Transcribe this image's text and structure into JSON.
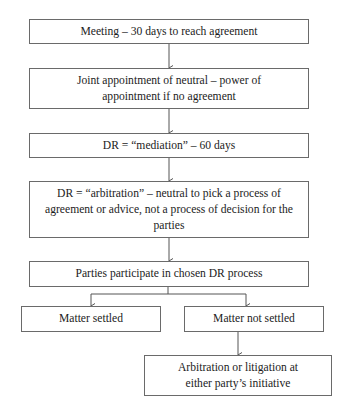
{
  "flowchart": {
    "nodes": [
      {
        "id": "meeting",
        "label": "Meeting – 30 days to reach agreement"
      },
      {
        "id": "joint-appointment",
        "label": "Joint appointment of neutral – power of appointment if no agreement"
      },
      {
        "id": "mediation",
        "label": "DR = “mediation” – 60 days"
      },
      {
        "id": "arbitration-process",
        "label": "DR = “arbitration” – neutral to pick a process of agreement or advice, not a process of decision for the parties"
      },
      {
        "id": "participate",
        "label": "Parties participate in chosen DR process"
      },
      {
        "id": "settled",
        "label": "Matter settled"
      },
      {
        "id": "not-settled",
        "label": "Matter not settled"
      },
      {
        "id": "escalation",
        "label": "Arbitration or litigation at either party’s initiative"
      }
    ],
    "edges": [
      {
        "from": "meeting",
        "to": "joint-appointment"
      },
      {
        "from": "joint-appointment",
        "to": "mediation"
      },
      {
        "from": "mediation",
        "to": "arbitration-process"
      },
      {
        "from": "arbitration-process",
        "to": "participate"
      },
      {
        "from": "participate",
        "to": "settled"
      },
      {
        "from": "participate",
        "to": "not-settled"
      },
      {
        "from": "not-settled",
        "to": "escalation"
      }
    ],
    "colors": {
      "border": "#6a6a6a",
      "line": "#555555",
      "text": "#1c1c1c"
    }
  }
}
